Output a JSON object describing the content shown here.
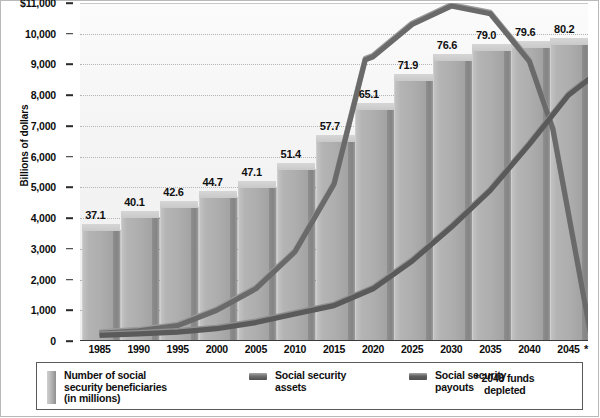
{
  "chart_data": {
    "type": "bar",
    "title": "",
    "xlabel": "",
    "ylabel": "Billions of dollars",
    "ylim": [
      0,
      11000
    ],
    "ytick_values": [
      0,
      1000,
      2000,
      3000,
      4000,
      5000,
      6000,
      7000,
      8000,
      9000,
      10000,
      11000
    ],
    "ytick_labels": [
      "0",
      "1,000",
      "2,000",
      "3,000",
      "4,000",
      "5,000",
      "6,000",
      "7,000",
      "8,000",
      "9,000",
      "10,000",
      "$11,000"
    ],
    "grid": true,
    "legend_position": "bottom",
    "categories": [
      "1985",
      "1990",
      "1995",
      "2000",
      "2005",
      "2010",
      "2015",
      "2020",
      "2025",
      "2030",
      "2035",
      "2040",
      "2045"
    ],
    "series": [
      {
        "name": "Number of social security beneficiaries (in millions)",
        "type": "bar",
        "unit": "millions",
        "values": [
          37.1,
          40.1,
          42.6,
          44.7,
          47.1,
          51.4,
          57.7,
          65.1,
          71.9,
          76.6,
          79.0,
          79.6,
          80.2
        ],
        "labels": [
          "37.1",
          "40.1",
          "42.6",
          "44.7",
          "47.1",
          "51.4",
          "57.7",
          "65.1",
          "71.9",
          "76.6",
          "79.0",
          "79.6",
          "80.2"
        ],
        "color": "#b0b0b0"
      },
      {
        "name": "Social security assets",
        "type": "line",
        "unit": "billions of dollars",
        "x": [
          "1985",
          "1990",
          "1995",
          "2000",
          "2005",
          "2010",
          "2015",
          "2019",
          "2020",
          "2025",
          "2030",
          "2035",
          "2040",
          "2043",
          "2048"
        ],
        "values": [
          250,
          330,
          500,
          1000,
          1700,
          2900,
          5100,
          9150,
          9250,
          10300,
          10900,
          10650,
          9100,
          6900,
          0
        ],
        "color": "#6f6f6f"
      },
      {
        "name": "Social security payouts",
        "type": "line",
        "unit": "billions of dollars",
        "x": [
          "1985",
          "1990",
          "1995",
          "2000",
          "2005",
          "2010",
          "2015",
          "2020",
          "2025",
          "2030",
          "2035",
          "2040",
          "2045",
          "2048"
        ],
        "values": [
          180,
          230,
          290,
          400,
          600,
          880,
          1150,
          1700,
          2600,
          3700,
          4900,
          6400,
          8000,
          8600
        ],
        "color": "#5e5e5e"
      }
    ],
    "annotations": [
      {
        "marker": "*",
        "text": "2048 funds depleted",
        "x_axis_marker": true
      }
    ]
  },
  "axis": {
    "y_title": "Billions of dollars",
    "y_labels": [
      "$11,000",
      "10,000",
      "9,000",
      "8,000",
      "7,000",
      "6,000",
      "5,000",
      "4,000",
      "3,000",
      "2,000",
      "1,000",
      "0"
    ],
    "x_labels": [
      "1985",
      "1990",
      "1995",
      "2000",
      "2005",
      "2010",
      "2015",
      "2020",
      "2025",
      "2030",
      "2035",
      "2040",
      "2045"
    ],
    "x_asterisk": "*"
  },
  "legend": {
    "items": [
      {
        "swatch": "bar-swatch",
        "line1": "Number of social",
        "line2": "security beneficiaries",
        "line3": "(in millions)",
        "color": "#b0b0b0"
      },
      {
        "swatch": "line-swatch-assets",
        "line1": "Social security",
        "line2": "assets",
        "line3": "",
        "color": "#6f6f6f"
      },
      {
        "swatch": "line-swatch-payouts",
        "line1": "Social security",
        "line2": "payouts",
        "line3": "",
        "color": "#5e5e5e"
      }
    ],
    "note": {
      "marker": "*",
      "line1": "2048 funds",
      "line2": "depleted"
    }
  }
}
